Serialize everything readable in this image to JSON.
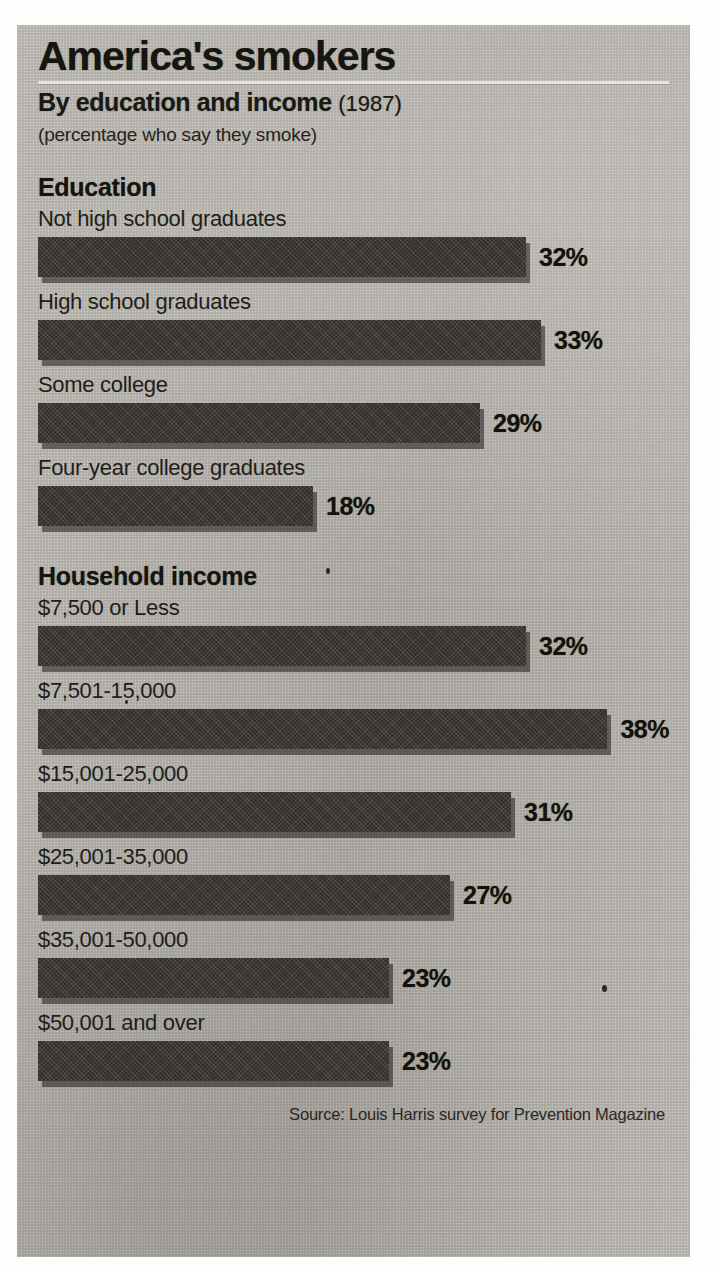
{
  "header": {
    "title": "America's smokers",
    "subtitle": "By education and income",
    "year": "(1987)",
    "note": "(percentage who say they smoke)"
  },
  "sections": [
    {
      "heading": "Education",
      "rows": [
        {
          "label": "Not high school graduates",
          "value": 32,
          "value_label": "32%"
        },
        {
          "label": "High school graduates",
          "value": 33,
          "value_label": "33%"
        },
        {
          "label": "Some college",
          "value": 29,
          "value_label": "29%"
        },
        {
          "label": "Four-year college graduates",
          "value": 18,
          "value_label": "18%"
        }
      ]
    },
    {
      "heading": "Household income",
      "rows": [
        {
          "label": "$7,500 or Less",
          "value": 32,
          "value_label": "32%"
        },
        {
          "label": "$7,501-15,000",
          "value": 38,
          "value_label": "38%"
        },
        {
          "label": "$15,001-25,000",
          "value": 31,
          "value_label": "31%"
        },
        {
          "label": "$25,001-35,000",
          "value": 27,
          "value_label": "27%"
        },
        {
          "label": "$35,001-50,000",
          "value": 23,
          "value_label": "23%"
        },
        {
          "label": "$50,001 and over",
          "value": 23,
          "value_label": "23%"
        }
      ]
    }
  ],
  "source": "Source: Louis Harris  survey for Prevention Magazine",
  "bleed_text": "smokers",
  "colors": {
    "bar": "#332f29",
    "paper": "#b4b0aa",
    "ink": "#17150f"
  },
  "chart_data": {
    "type": "bar",
    "orientation": "horizontal",
    "title": "America's smokers",
    "subtitle": "By education and income (1987)",
    "ylabel": "(percentage who say they smoke)",
    "xlabel": "",
    "unit": "%",
    "xlim": [
      0,
      40
    ],
    "grid": false,
    "legend": null,
    "groups": [
      {
        "name": "Education",
        "categories": [
          "Not high school graduates",
          "High school graduates",
          "Some college",
          "Four-year college graduates"
        ],
        "values": [
          32,
          33,
          29,
          18
        ]
      },
      {
        "name": "Household income",
        "categories": [
          "$7,500 or Less",
          "$7,501-15,000",
          "$15,001-25,000",
          "$25,001-35,000",
          "$35,001-50,000",
          "$50,001 and over"
        ],
        "values": [
          32,
          38,
          31,
          27,
          23,
          23
        ]
      }
    ],
    "annotation": "Source: Louis Harris  survey for Prevention Magazine"
  }
}
